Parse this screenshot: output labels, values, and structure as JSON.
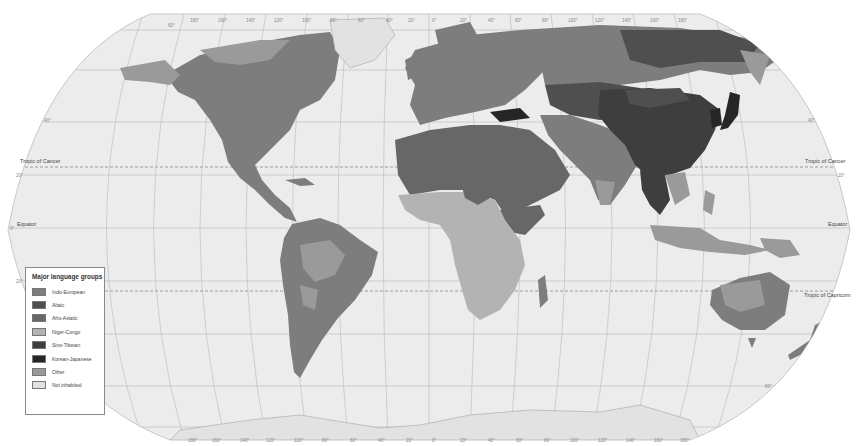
{
  "map": {
    "title": "Major language groups",
    "projection": "Robinson-style world map",
    "background_color": "#ffffff",
    "ocean_color": "#ececec",
    "graticule_color": "#b4b4b4",
    "reference_lines": {
      "tropic_of_cancer": "Tropic of Cancer",
      "equator": "Equator",
      "tropic_of_capricorn": "Tropic of Capricorn"
    },
    "latitude_ticks": [
      "60°",
      "40°",
      "20°",
      "0°",
      "20°",
      "40°",
      "60°"
    ],
    "longitude_ticks": [
      "180°",
      "160°",
      "140°",
      "120°",
      "100°",
      "80°",
      "60°",
      "40°",
      "20°",
      "0°",
      "20°",
      "40°",
      "60°",
      "80°",
      "100°",
      "120°",
      "140°",
      "160°",
      "180°"
    ]
  },
  "legend": {
    "title": "Major language groups",
    "items": [
      {
        "label": "Indo-European",
        "color": "#7d7d7d"
      },
      {
        "label": "Altaic",
        "color": "#4f4f4f"
      },
      {
        "label": "Afro-Asiatic",
        "color": "#676767"
      },
      {
        "label": "Niger-Congo",
        "color": "#b3b3b3"
      },
      {
        "label": "Sino-Tibetan",
        "color": "#3e3e3e"
      },
      {
        "label": "Korean-Japanese",
        "color": "#262626"
      },
      {
        "label": "Other",
        "color": "#9a9a9a"
      },
      {
        "label": "Not inhabited",
        "color": "#e2e2e2"
      }
    ]
  }
}
